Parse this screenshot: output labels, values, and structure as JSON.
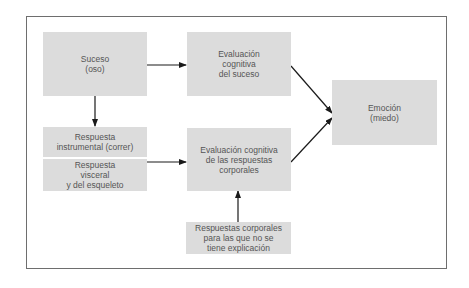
{
  "diagram": {
    "nodes": {
      "suceso": {
        "lines": [
          "Suceso",
          "(oso)"
        ]
      },
      "evaluacion_suceso": {
        "lines": [
          "Evaluación",
          "cognitiva",
          "del suceso"
        ]
      },
      "respuesta_instrumental": {
        "lines": [
          "Respuesta",
          "instrumental (correr)"
        ]
      },
      "respuesta_visceral": {
        "lines": [
          "Respuesta",
          "visceral",
          "y del esqueleto"
        ]
      },
      "evaluacion_respuestas": {
        "lines": [
          "Evaluación cognitiva",
          "de las respuestas",
          "corporales"
        ]
      },
      "respuestas_sin_explicacion": {
        "lines": [
          "Respuestas corporales",
          "para las que no se",
          "tiene explicación"
        ]
      },
      "emocion": {
        "lines": [
          "Emoción",
          "(miedo)"
        ]
      }
    },
    "edges": [
      {
        "from": "suceso",
        "to": "evaluacion_suceso"
      },
      {
        "from": "suceso",
        "to": "respuesta_instrumental"
      },
      {
        "from": "respuesta_visceral",
        "to": "evaluacion_respuestas"
      },
      {
        "from": "respuestas_sin_explicacion",
        "to": "evaluacion_respuestas"
      },
      {
        "from": "evaluacion_suceso",
        "to": "emocion"
      },
      {
        "from": "evaluacion_respuestas",
        "to": "emocion"
      }
    ],
    "colors": {
      "box_fill": "#dcdcdc",
      "text": "#555555",
      "arrow": "#1a1a1a",
      "frame": "#6e6e6e"
    }
  }
}
